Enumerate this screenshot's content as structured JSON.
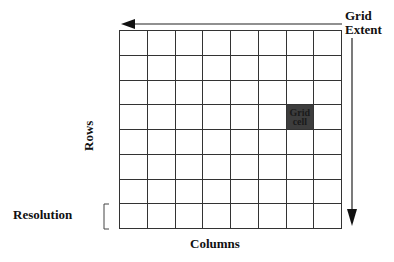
{
  "diagram": {
    "labels": {
      "extent_line1": "Grid",
      "extent_line2": "Extent",
      "rows": "Rows",
      "columns": "Columns",
      "resolution": "Resolution",
      "cell_line1": "Grid",
      "cell_line2": "cell"
    },
    "grid": {
      "rows": 8,
      "columns": 8,
      "highlighted_cell": {
        "row": 3,
        "column": 6
      },
      "highlight_color": "#3d3d3d",
      "line_color": "#333333"
    },
    "arrows": [
      {
        "name": "horizontal-extent-arrow",
        "direction": "left"
      },
      {
        "name": "vertical-extent-arrow",
        "direction": "down"
      }
    ]
  }
}
